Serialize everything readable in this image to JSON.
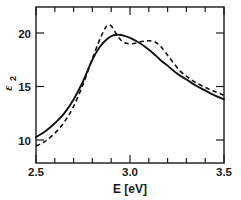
{
  "chart_data": {
    "type": "line",
    "title": "",
    "xlabel": "E [eV]",
    "ylabel": "ε₂",
    "ylabel_main": "ε",
    "ylabel_sub": "2",
    "xlim": [
      2.5,
      3.5
    ],
    "ylim": [
      6.6,
      22.3
    ],
    "grid": false,
    "legend": "none",
    "x_tick_labels": [
      "2.5",
      "3.0",
      "3.5"
    ],
    "x_tick_values": [
      2.5,
      3.0,
      3.5
    ],
    "x_minor_tick_values": [
      2.6,
      2.7,
      2.8,
      2.9,
      3.1,
      3.2,
      3.3,
      3.4
    ],
    "y_tick_labels": [
      "10",
      "15",
      "20"
    ],
    "y_tick_values": [
      10,
      15,
      20
    ],
    "series": [
      {
        "name": "solid",
        "style": "solid",
        "color": "#111111",
        "x": [
          2.5,
          2.55,
          2.6,
          2.65,
          2.7,
          2.75,
          2.8,
          2.84,
          2.88,
          2.91,
          2.94,
          2.97,
          3.0,
          3.04,
          3.08,
          3.12,
          3.16,
          3.2,
          3.25,
          3.3,
          3.35,
          3.4,
          3.45,
          3.5
        ],
        "y": [
          9.2,
          9.8,
          10.6,
          11.6,
          13.0,
          14.8,
          17.0,
          18.3,
          19.1,
          19.45,
          19.5,
          19.4,
          19.2,
          18.8,
          18.3,
          17.7,
          17.0,
          16.4,
          15.6,
          15.0,
          14.4,
          13.9,
          13.4,
          13.0
        ]
      },
      {
        "name": "dashed",
        "style": "dashed",
        "color": "#111111",
        "x": [
          2.5,
          2.55,
          2.6,
          2.65,
          2.7,
          2.75,
          2.79,
          2.83,
          2.86,
          2.88,
          2.9,
          2.92,
          2.95,
          2.98,
          3.01,
          3.04,
          3.07,
          3.1,
          3.13,
          3.16,
          3.19,
          3.23,
          3.27,
          3.31,
          3.35,
          3.4,
          3.45,
          3.5
        ],
        "y": [
          8.3,
          8.8,
          9.6,
          10.7,
          12.3,
          14.5,
          16.6,
          18.6,
          19.9,
          20.45,
          20.4,
          19.8,
          19.0,
          18.65,
          18.6,
          18.7,
          18.85,
          18.9,
          18.8,
          18.4,
          17.7,
          16.7,
          15.8,
          15.2,
          14.7,
          14.2,
          13.8,
          13.4
        ]
      }
    ]
  },
  "axes": {
    "x_title": "E [eV]",
    "y_title_main": "ε",
    "y_title_sub": "2"
  }
}
